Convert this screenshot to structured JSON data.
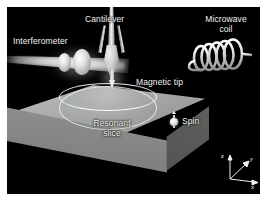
{
  "figure": {
    "background_color": "#000000",
    "frame_margin_color": "#ffffff",
    "label_color": "#f2f2f2"
  },
  "labels": {
    "interferometer": "Interferometer",
    "cantilever": "Cantilever",
    "microwave_coil_line1": "Microwave",
    "microwave_coil_line2": "coil",
    "magnetic_tip": "Magnetic tip",
    "resonant_slice_line1": "Resonant",
    "resonant_slice_line2": "slice",
    "spin": "Spin"
  },
  "axes": {
    "z": "z",
    "y": "y",
    "x": "x"
  },
  "components": {
    "interferometer_beam": "laser-beam",
    "lens_count": 2,
    "coil_turns": 5,
    "sample_block": "sample-substrate",
    "resonant_slice_shape": "bowl"
  },
  "colors": {
    "block_top": "#b0b3b0",
    "block_front": "#838683",
    "block_side": "#545754",
    "beam": "#cdd0cd",
    "coil": "#dfe1df",
    "label": "#f2f2f2"
  }
}
